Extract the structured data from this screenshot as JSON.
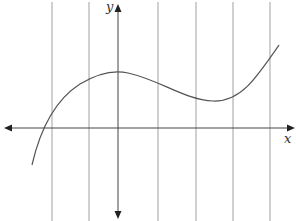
{
  "diagram": {
    "type": "function-graph",
    "axes": {
      "x_label": "x",
      "y_label": "y"
    },
    "vertical_lines_x_px": [
      52,
      89,
      158,
      196,
      233,
      270
    ],
    "y_axis_x_px": 118,
    "x_axis_y_px": 128,
    "curve_description": "cubic-like curve rising from lower left, local maximum on the y-axis, local minimum to the right, then rising to upper right",
    "colors": {
      "lines": "#999999",
      "axes": "#333333",
      "curve": "#555555"
    }
  }
}
